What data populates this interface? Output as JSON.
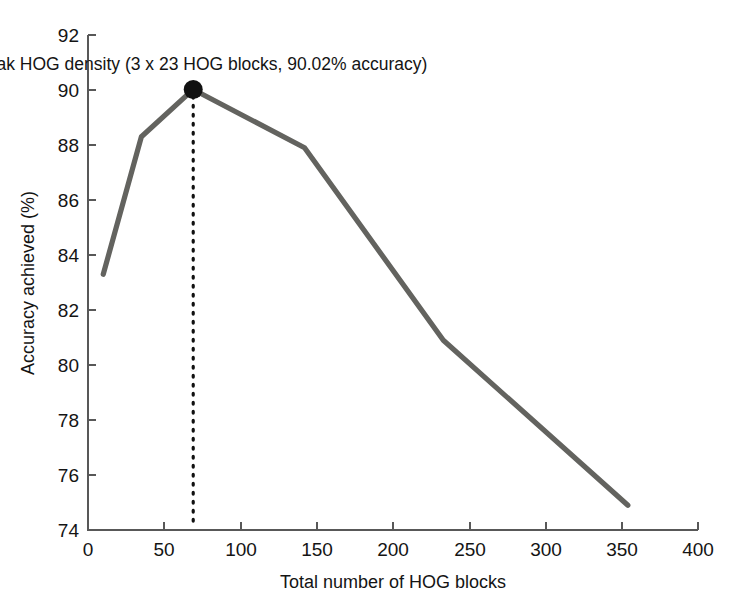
{
  "chart_data": {
    "type": "line",
    "title": "",
    "xlabel": "Total number of HOG blocks",
    "ylabel": "Accuracy achieved (%)",
    "xlim": [
      0,
      400
    ],
    "ylim": [
      74,
      92
    ],
    "xticks": [
      0,
      50,
      100,
      150,
      200,
      250,
      300,
      350,
      400
    ],
    "yticks": [
      74,
      76,
      78,
      80,
      82,
      84,
      86,
      88,
      90,
      92
    ],
    "xtick_labels": [
      "0",
      "50",
      "100",
      "150",
      "200",
      "250",
      "300",
      "350",
      "400"
    ],
    "ytick_labels": [
      "74",
      "76",
      "78",
      "80",
      "82",
      "84",
      "86",
      "88",
      "90",
      "92"
    ],
    "grid": false,
    "legend": false,
    "series": [
      {
        "name": "Accuracy achieved",
        "color": "#63635f",
        "x": [
          10,
          35,
          69,
          142,
          233,
          354
        ],
        "values": [
          83.3,
          88.3,
          90.02,
          87.9,
          80.9,
          74.9
        ]
      }
    ],
    "annotations": [
      {
        "name": "peak-annotation",
        "text": "Peak HOG density (3 x 23 HOG blocks, 90.02% accuracy)",
        "point_x": 69,
        "point_y": 90.02,
        "marker": "filled-circle",
        "marker_color": "#111111",
        "guide_line": "dotted-vertical",
        "guide_from_y": 74
      }
    ]
  },
  "axes": {
    "x_title": "Total number of HOG blocks",
    "y_title": "Accuracy achieved (%)"
  },
  "ticks": {
    "x": [
      "0",
      "50",
      "100",
      "150",
      "200",
      "250",
      "300",
      "350",
      "400"
    ],
    "y": [
      "74",
      "76",
      "78",
      "80",
      "82",
      "84",
      "86",
      "88",
      "90",
      "92"
    ]
  },
  "annotation": {
    "peak_label": "Peak HOG density (3 x 23 HOG blocks, 90.02% accuracy)"
  },
  "colors": {
    "line": "#63635f",
    "marker": "#111111",
    "axis": "#585858",
    "text": "#141414",
    "background": "#ffffff"
  }
}
